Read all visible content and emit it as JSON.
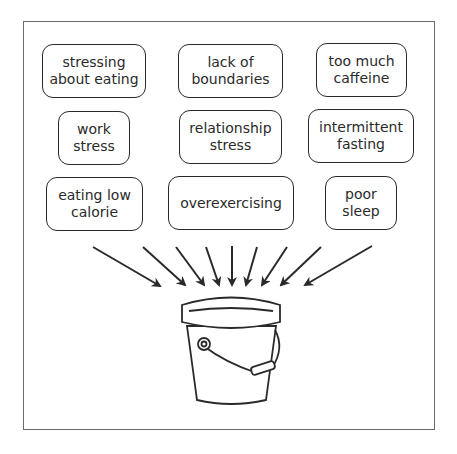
{
  "diagram": {
    "type": "stressors-into-bucket",
    "colors": {
      "stroke": "#2a2a2a",
      "frame": "#6a6a6a",
      "background": "#ffffff"
    },
    "boxes": [
      {
        "id": "stressing-about-eating",
        "label": "stressing\nabout eating",
        "x": 42,
        "y": 44,
        "w": 104,
        "h": 54
      },
      {
        "id": "lack-of-boundaries",
        "label": "lack of\nboundaries",
        "x": 178,
        "y": 44,
        "w": 105,
        "h": 54
      },
      {
        "id": "too-much-caffeine",
        "label": "too much\ncaffeine",
        "x": 316,
        "y": 43,
        "w": 91,
        "h": 54
      },
      {
        "id": "work-stress",
        "label": "work\nstress",
        "x": 58,
        "y": 111,
        "w": 72,
        "h": 54
      },
      {
        "id": "relationship-stress",
        "label": "relationship\nstress",
        "x": 179,
        "y": 110,
        "w": 103,
        "h": 54
      },
      {
        "id": "intermittent-fasting",
        "label": "intermittent\nfasting",
        "x": 308,
        "y": 109,
        "w": 106,
        "h": 54
      },
      {
        "id": "eating-low-calorie",
        "label": "eating low\ncalorie",
        "x": 46,
        "y": 177,
        "w": 97,
        "h": 54
      },
      {
        "id": "overexercising",
        "label": "overexercising",
        "x": 168,
        "y": 176,
        "w": 126,
        "h": 54
      },
      {
        "id": "poor-sleep",
        "label": "poor\nsleep",
        "x": 325,
        "y": 176,
        "w": 72,
        "h": 54
      }
    ],
    "arrow_count": 9,
    "target": "bucket"
  }
}
